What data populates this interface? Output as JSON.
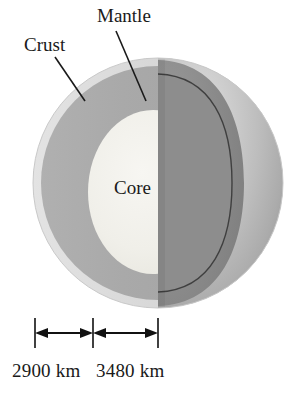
{
  "figure": {
    "background_color": "#ffffff"
  },
  "labels": {
    "crust": "Crust",
    "mantle": "Mantle",
    "core": "Core"
  },
  "scale_bars": [
    {
      "name": "crust-mantle-span",
      "label": "2900 km",
      "value": 2900,
      "unit": "km"
    },
    {
      "name": "core-radius-span",
      "label": "3480 km",
      "value": 3480,
      "unit": "km"
    }
  ],
  "scale": {
    "left_label": "2900 km",
    "right_label": "3480 km"
  },
  "colors": {
    "crust": "#d8d8d8",
    "mantle": "#a8a8a8",
    "mantle_cut_shadow": "#8a8a8a",
    "core": "#f0efea",
    "outer_surface_light": "#d6d6d6",
    "outer_surface_mid": "#b4b4b4",
    "outer_surface_dark": "#949494",
    "outline": "#3a3a3a",
    "text": "#1a1a1a"
  },
  "geometry": {
    "sphere_center_x": 158,
    "sphere_center_y": 183,
    "sphere_radius_x": 125,
    "sphere_radius_y": 125,
    "cut_plane_x": 158,
    "core_radius_x": 65,
    "core_radius_y": 82,
    "tick_positions_x": [
      35,
      93,
      158
    ],
    "tick_top_y": 318,
    "tick_bottom_y": 348,
    "arrow_axis_y": 333
  }
}
